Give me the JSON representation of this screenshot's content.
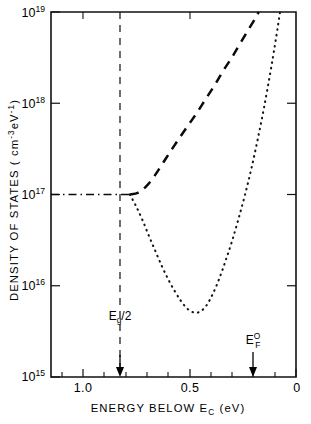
{
  "figure": {
    "name": "density-of-states-vs-energy-below-Ec"
  },
  "chart_data": {
    "type": "line",
    "title": "",
    "xlabel": "ENERGY BELOW E_C (eV)",
    "xlabel_parts": {
      "main": "ENERGY BELOW E",
      "sub": "C",
      "units": "(eV)"
    },
    "ylabel": "DENSITY OF STATES (cm^-3 eV^-1)",
    "ylabel_parts": {
      "main": "DENSITY OF STATES",
      "units_open": "( cm",
      "units_sup1": "-3",
      "units_mid": "eV",
      "units_sup2": "-1",
      "units_close": ")"
    },
    "xscale": "linear",
    "x_reversed": true,
    "xlim": [
      1.15,
      0.0
    ],
    "yscale": "log",
    "ylim": [
      1000000000000000.0,
      1e+19
    ],
    "grid": false,
    "legend": null,
    "x_ticks_major": [
      1.0,
      0.5,
      0.0
    ],
    "x_tick_labels": [
      "1.0",
      "0.5",
      "0"
    ],
    "x_ticks_minor": [
      1.1,
      0.9,
      0.8,
      0.7,
      0.6,
      0.4,
      0.3,
      0.2,
      0.1
    ],
    "y_ticks_major": [
      1e+19,
      1e+18,
      1e+17,
      1e+16,
      1000000000000000.0
    ],
    "y_tick_labels": [
      {
        "base": "10",
        "exp": "19"
      },
      {
        "base": "10",
        "exp": "18"
      },
      {
        "base": "10",
        "exp": "17"
      },
      {
        "base": "10",
        "exp": "16"
      },
      {
        "base": "10",
        "exp": "15"
      }
    ],
    "series": [
      {
        "name": "dashed-curve",
        "style": "dashed",
        "points": [
          [
            0.78,
            1e+17
          ],
          [
            0.74,
            1.05e+17
          ],
          [
            0.7,
            1.25e+17
          ],
          [
            0.66,
            1.65e+17
          ],
          [
            0.62,
            2.3e+17
          ],
          [
            0.58,
            3.2e+17
          ],
          [
            0.54,
            4.4e+17
          ],
          [
            0.5,
            6e+17
          ],
          [
            0.46,
            8.2e+17
          ],
          [
            0.42,
            1.15e+18
          ],
          [
            0.38,
            1.6e+18
          ],
          [
            0.34,
            2.3e+18
          ],
          [
            0.3,
            3.2e+18
          ],
          [
            0.26,
            4.6e+18
          ],
          [
            0.22,
            6.6e+18
          ],
          [
            0.19,
            8.6e+18
          ],
          [
            0.175,
            1e+19
          ]
        ]
      },
      {
        "name": "dotted-curve",
        "style": "dotted",
        "points": [
          [
            0.78,
            1e+17
          ],
          [
            0.75,
            7.4e+16
          ],
          [
            0.72,
            5.2e+16
          ],
          [
            0.69,
            3.5e+16
          ],
          [
            0.66,
            2.4e+16
          ],
          [
            0.63,
            1.65e+16
          ],
          [
            0.6,
            1.18e+16
          ],
          [
            0.57,
            8800000000000000.0
          ],
          [
            0.54,
            6800000000000000.0
          ],
          [
            0.51,
            5600000000000000.0
          ],
          [
            0.48,
            5100000000000000.0
          ],
          [
            0.45,
            5200000000000000.0
          ],
          [
            0.42,
            6100000000000000.0
          ],
          [
            0.39,
            8200000000000000.0
          ],
          [
            0.36,
            1.2e+16
          ],
          [
            0.33,
            1.9e+16
          ],
          [
            0.3,
            3.1e+16
          ],
          [
            0.27,
            5.4e+16
          ],
          [
            0.24,
            9.8e+16
          ],
          [
            0.21,
            1.9e+17
          ],
          [
            0.18,
            4e+17
          ],
          [
            0.15,
            9e+17
          ],
          [
            0.12,
            2.2e+18
          ],
          [
            0.1,
            4.2e+18
          ],
          [
            0.085,
            7e+18
          ],
          [
            0.075,
            1e+19
          ]
        ]
      },
      {
        "name": "dash-dot-baseline",
        "style": "dashdot",
        "points": [
          [
            1.15,
            1e+17
          ],
          [
            0.78,
            1e+17
          ]
        ]
      }
    ],
    "annotations": [
      {
        "name": "eg-half",
        "label": "Eg/2",
        "label_parts": {
          "main": "E",
          "sub": "g",
          "tail": "/2"
        },
        "x": 0.8,
        "vline": true,
        "vline_from": 1e+19,
        "vline_to": 1000000000000000.0,
        "arrow": true,
        "label_y": 2200000000000000.0
      },
      {
        "name": "fermi-level-zero",
        "label": "EF0",
        "label_parts": {
          "main": "E",
          "sub": "F",
          "sup": "O"
        },
        "x": 0.205,
        "vline": false,
        "arrow": true,
        "label_y": 2400000000000000.0
      }
    ],
    "colors": {
      "axis": "#111111",
      "curve": "#0b0b0b",
      "background": "#ffffff"
    }
  }
}
